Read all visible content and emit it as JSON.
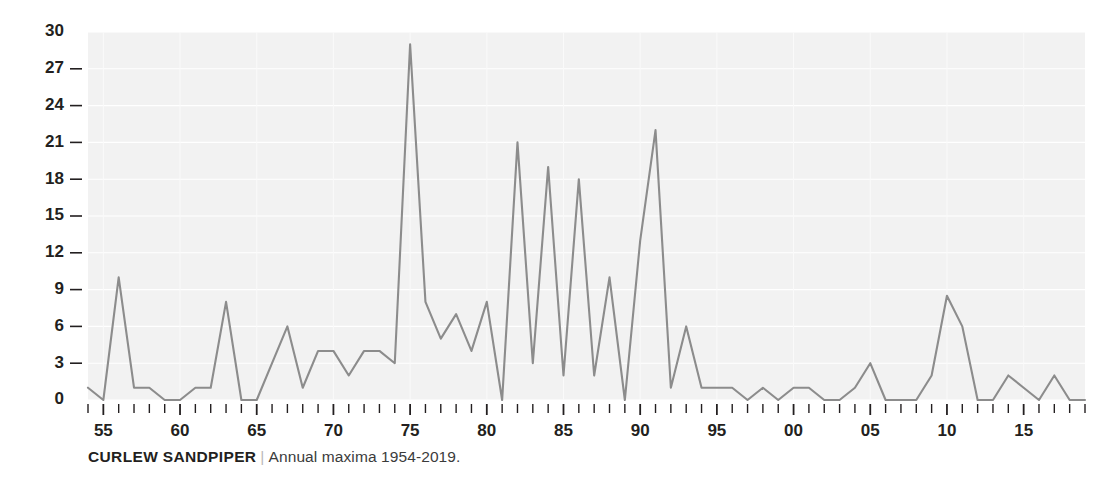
{
  "caption": {
    "species": "CURLEW SANDPIPER",
    "separator": "|",
    "description": "Annual maxima 1954-2019."
  },
  "chart_data": {
    "type": "line",
    "title": "CURLEW SANDPIPER",
    "subtitle": "Annual maxima 1954-2019.",
    "xlabel": "",
    "ylabel": "",
    "grid": true,
    "legend": null,
    "line_color": "#8c8c8c",
    "plot_background": "#f2f2f2",
    "xlim": [
      1954,
      2019
    ],
    "ylim": [
      0,
      30
    ],
    "yticks": [
      0,
      3,
      6,
      9,
      12,
      15,
      18,
      21,
      24,
      27,
      30
    ],
    "ytick_labels": [
      "0",
      "3",
      "6",
      "9",
      "12",
      "15",
      "18",
      "21",
      "24",
      "27",
      "30"
    ],
    "xticks": [
      1955,
      1960,
      1965,
      1970,
      1975,
      1980,
      1985,
      1990,
      1995,
      2000,
      2005,
      2010,
      2015
    ],
    "xtick_labels": [
      "55",
      "60",
      "65",
      "70",
      "75",
      "80",
      "85",
      "90",
      "95",
      "00",
      "05",
      "10",
      "15"
    ],
    "x": [
      1954,
      1955,
      1956,
      1957,
      1958,
      1959,
      1960,
      1961,
      1962,
      1963,
      1964,
      1965,
      1966,
      1967,
      1968,
      1969,
      1970,
      1971,
      1972,
      1973,
      1974,
      1975,
      1976,
      1977,
      1978,
      1979,
      1980,
      1981,
      1982,
      1983,
      1984,
      1985,
      1986,
      1987,
      1988,
      1989,
      1990,
      1991,
      1992,
      1993,
      1994,
      1995,
      1996,
      1997,
      1998,
      1999,
      2000,
      2001,
      2002,
      2003,
      2004,
      2005,
      2006,
      2007,
      2008,
      2009,
      2010,
      2011,
      2012,
      2013,
      2014,
      2015,
      2016,
      2017,
      2018,
      2019
    ],
    "values": [
      1,
      0,
      10,
      1,
      1,
      0,
      0,
      1,
      1,
      8,
      0,
      0,
      3,
      6,
      1,
      4,
      4,
      2,
      4,
      4,
      3,
      29,
      8,
      5,
      7,
      4,
      8,
      0,
      21,
      3,
      19,
      2,
      18,
      2,
      10,
      0,
      13,
      22,
      1,
      6,
      1,
      1,
      1,
      0,
      1,
      0,
      1,
      1,
      0,
      0,
      1,
      3,
      0,
      0,
      0,
      2,
      8.5,
      6,
      0,
      0,
      2,
      1,
      0,
      2,
      0,
      0
    ],
    "series_name": "Annual maxima"
  }
}
